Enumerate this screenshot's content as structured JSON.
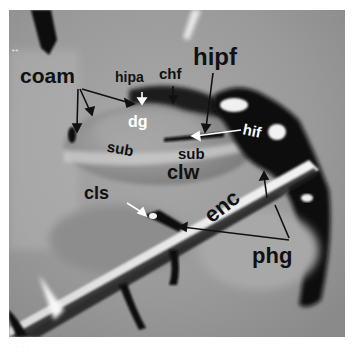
{
  "figure": {
    "type": "MRI coronal/sagittal section of medial temporal lobe (grayscale)",
    "orientation_marker": "↔",
    "background_color": "#8f8f8f",
    "label_color_dark": "#111111",
    "label_color_light": "#ffffff"
  },
  "labels": {
    "coam": "coam",
    "hipa": "hipa",
    "chf": "chf",
    "hipf": "hipf",
    "dg": "dg",
    "hif": "hif",
    "sub_left": "sub",
    "sub_right": "sub",
    "clw": "clw",
    "cls": "cls",
    "enc": "enc",
    "phg": "phg"
  },
  "footer": {
    "scale_text": "· · · · ·"
  }
}
